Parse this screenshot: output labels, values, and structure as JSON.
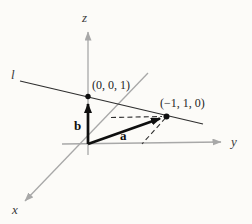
{
  "diagram": {
    "background_color": "#fcfbf8",
    "axis_color": "#a8a8a8",
    "line_color": "#2e2e2e",
    "vector_color": "#0f0f0f",
    "axis_labels": {
      "x": "x",
      "y": "y",
      "z": "z"
    },
    "line_label": "l",
    "point_labels": {
      "on_z_axis": "(0, 0, 1)",
      "on_xy_plane": "(−1, 1, 0)"
    },
    "vector_labels": {
      "a": "a",
      "b": "b"
    }
  }
}
